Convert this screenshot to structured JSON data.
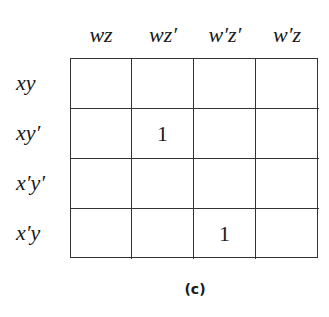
{
  "kmap": {
    "column_labels": [
      "wz",
      "wz′",
      "w′z′",
      "w′z"
    ],
    "row_labels": [
      "xy",
      "xy′",
      "x′y′",
      "x′y"
    ],
    "cells": [
      [
        "",
        "",
        "",
        ""
      ],
      [
        "",
        "1",
        "",
        ""
      ],
      [
        "",
        "",
        "",
        ""
      ],
      [
        "",
        "",
        "1",
        ""
      ]
    ]
  },
  "caption": "(c)"
}
